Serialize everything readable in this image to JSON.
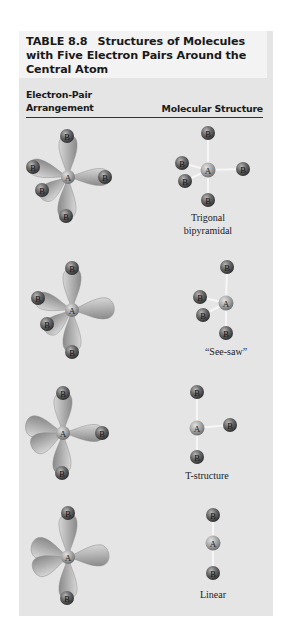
{
  "table": {
    "number": "TABLE 8.8",
    "title": "Structures of Molecules with Five Electron Pairs Around the Central Atom"
  },
  "columns": {
    "left_line1": "Electron-Pair",
    "left_line2": "Arrangement",
    "right": "Molecular Structure"
  },
  "atoms": {
    "central": "A",
    "ligand": "B"
  },
  "rows": [
    {
      "electron_pair": "Trigonal bipyramidal (5 bonding pairs)",
      "structure_line1": "Trigonal",
      "structure_line2": "bipyramidal"
    },
    {
      "electron_pair": "Trigonal bipyramidal (4 bonding, 1 lone pair)",
      "structure_line1": "“See-saw”",
      "structure_line2": ""
    },
    {
      "electron_pair": "Trigonal bipyramidal (3 bonding, 2 lone pairs)",
      "structure_line1": "T-structure",
      "structure_line2": ""
    },
    {
      "electron_pair": "Trigonal bipyramidal (2 bonding, 3 lone pairs)",
      "structure_line1": "Linear",
      "structure_line2": ""
    }
  ],
  "colors": {
    "panel": "#e5e5e5",
    "title_band": "#f3f3f3",
    "lobe": "#b5b5b5",
    "ligand_atom": "#6a6a6a",
    "central_atom": "#a8a8a8",
    "bond": "#f4f4f4"
  }
}
